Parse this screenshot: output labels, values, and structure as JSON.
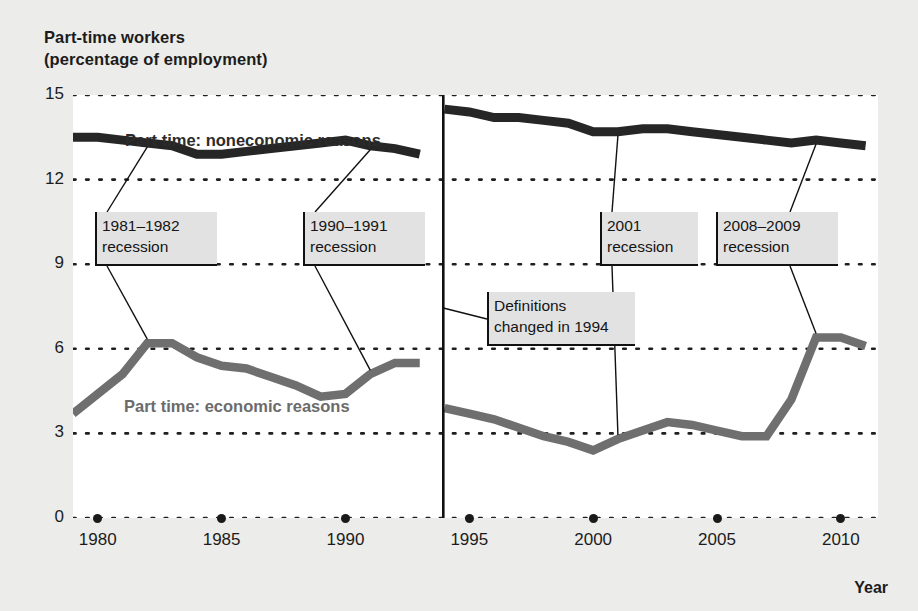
{
  "title_line1": "Part-time workers",
  "title_line2": "(percentage of employment)",
  "year_caption": "Year",
  "series_labels": {
    "noneconomic": "Part time: noneconomic reasons",
    "economic": "Part time: economic reasons"
  },
  "annotations": [
    {
      "id": "rec-1981",
      "line1": "1981–1982",
      "line2": "recession",
      "x": 95,
      "y": 212,
      "w": 122,
      "h": 54
    },
    {
      "id": "rec-1990",
      "line1": "1990–1991",
      "line2": "recession",
      "x": 303,
      "y": 212,
      "w": 122,
      "h": 54
    },
    {
      "id": "definitions-1994",
      "line1": "Definitions",
      "line2": "changed in 1994",
      "x": 487,
      "y": 292,
      "w": 148,
      "h": 54
    },
    {
      "id": "rec-2001",
      "line1": "2001",
      "line2": "recession",
      "x": 600,
      "y": 212,
      "w": 98,
      "h": 54
    },
    {
      "id": "rec-2008",
      "line1": "2008–2009",
      "line2": "recession",
      "x": 716,
      "y": 212,
      "w": 122,
      "h": 54
    }
  ],
  "colors": {
    "noneconomic_line": "#262626",
    "economic_line": "#6f6f6f",
    "background": "#ececea",
    "plot_background": "#ffffff",
    "gridline": "#1f1f1f",
    "annotation_bg": "#e2e2e2",
    "annotation_rule": "#111111"
  },
  "chart_data": {
    "type": "line",
    "title": "Part-time workers (percentage of employment)",
    "xlabel": "Year",
    "ylabel": "Part-time workers (percentage of employment)",
    "xlim": [
      1979,
      2011.5
    ],
    "ylim": [
      0,
      15
    ],
    "yticks": [
      0,
      3,
      6,
      9,
      12,
      15
    ],
    "xticks": [
      1980,
      1985,
      1990,
      1995,
      2000,
      2005,
      2010
    ],
    "grid": "horizontal-dotted",
    "legend": "inline-labels",
    "break_at": 1994,
    "break_note": "Definitions changed in 1994",
    "series": [
      {
        "name": "Part time: noneconomic reasons",
        "color": "#262626",
        "segments": [
          {
            "x": [
              1979,
              1980,
              1981,
              1982,
              1983,
              1984,
              1985,
              1986,
              1987,
              1988,
              1989,
              1990,
              1991,
              1992,
              1993
            ],
            "values": [
              13.5,
              13.5,
              13.4,
              13.3,
              13.2,
              12.9,
              12.9,
              13.0,
              13.1,
              13.2,
              13.3,
              13.4,
              13.2,
              13.1,
              12.9
            ]
          },
          {
            "x": [
              1994,
              1995,
              1996,
              1997,
              1998,
              1999,
              2000,
              2001,
              2002,
              2003,
              2004,
              2005,
              2006,
              2007,
              2008,
              2009,
              2010,
              2011
            ],
            "values": [
              14.5,
              14.4,
              14.2,
              14.2,
              14.1,
              14.0,
              13.7,
              13.7,
              13.8,
              13.8,
              13.7,
              13.6,
              13.5,
              13.4,
              13.3,
              13.4,
              13.3,
              13.2
            ]
          }
        ]
      },
      {
        "name": "Part time: economic reasons",
        "color": "#6f6f6f",
        "segments": [
          {
            "x": [
              1979,
              1980,
              1981,
              1982,
              1983,
              1984,
              1985,
              1986,
              1987,
              1988,
              1989,
              1990,
              1991,
              1992,
              1993
            ],
            "values": [
              3.7,
              4.4,
              5.1,
              6.2,
              6.2,
              5.7,
              5.4,
              5.3,
              5.0,
              4.7,
              4.3,
              4.4,
              5.1,
              5.5,
              5.5
            ]
          },
          {
            "x": [
              1994,
              1995,
              1996,
              1997,
              1998,
              1999,
              2000,
              2001,
              2002,
              2003,
              2004,
              2005,
              2006,
              2007,
              2008,
              2009,
              2010,
              2011
            ],
            "values": [
              3.9,
              3.7,
              3.5,
              3.2,
              2.9,
              2.7,
              2.4,
              2.8,
              3.1,
              3.4,
              3.3,
              3.1,
              2.9,
              2.9,
              4.2,
              6.4,
              6.4,
              6.1
            ]
          }
        ]
      }
    ],
    "leader_lines": [
      {
        "label": "1981–1982 recession",
        "year": 1982
      },
      {
        "label": "1990–1991 recession",
        "year": 1991
      },
      {
        "label": "2001 recession",
        "year": 2001
      },
      {
        "label": "2008–2009 recession",
        "year": 2009
      }
    ]
  }
}
